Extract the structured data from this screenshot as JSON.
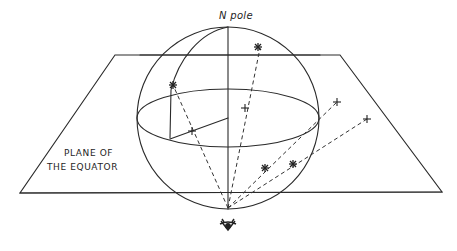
{
  "diagram": {
    "labels": {
      "north_pole": "N pole",
      "plane_line1": "PLANE OF",
      "plane_line2": "THE EQUATOR"
    },
    "symbols": {
      "star": "star-symbol",
      "projection": "plus-symbol",
      "observer": "eye-icon"
    },
    "colors": {
      "ink": "#2a2a2a",
      "background": "#ffffff"
    }
  }
}
